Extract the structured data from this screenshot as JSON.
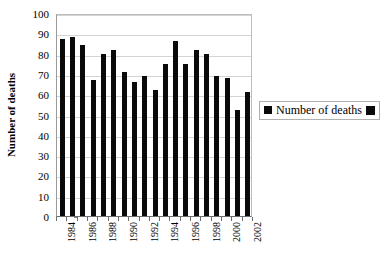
{
  "chart_data": {
    "type": "bar",
    "title": "",
    "subtitle": "",
    "xlabel": "",
    "ylabel": "Number of deaths",
    "ylim": [
      0,
      100
    ],
    "ytick_step": 10,
    "yticks": [
      0,
      10,
      20,
      30,
      40,
      50,
      60,
      70,
      80,
      90,
      100
    ],
    "grid": true,
    "legend_position": "right",
    "categories": [
      "1984",
      "1985",
      "1986",
      "1987",
      "1988",
      "1989",
      "1990",
      "1991",
      "1992",
      "1993",
      "1994",
      "1995",
      "1996",
      "1997",
      "1998",
      "1999",
      "2000",
      "2001",
      "2002"
    ],
    "xtick_labels_shown": [
      "1984",
      "1986",
      "1988",
      "1990",
      "1992",
      "1994",
      "1996",
      "1998",
      "2000",
      "2002"
    ],
    "series": [
      {
        "name": "Number of deaths",
        "color": "#0a0a0a",
        "values": [
          87,
          88,
          84,
          67,
          80,
          82,
          71,
          66,
          69,
          62,
          75,
          86,
          75,
          82,
          80,
          69,
          68,
          52,
          61
        ]
      }
    ]
  },
  "legend": {
    "label": "Number of deaths",
    "marker_left": "black-square-marker",
    "marker_right": "black-square-marker"
  },
  "axes": {
    "y_title": "Number of deaths"
  },
  "colors": {
    "bar": "#0a0a0a",
    "gridline": "#d4d4d4",
    "axis": "#6e6e6e",
    "plot_border": "#bdbdbd",
    "background": "#ffffff"
  }
}
